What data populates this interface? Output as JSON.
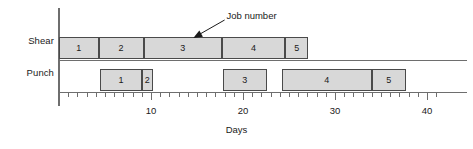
{
  "chart_data": {
    "type": "bar",
    "subtype": "gantt",
    "title": "",
    "xlabel": "Days",
    "ylabel": "",
    "xlim": [
      0,
      42
    ],
    "ylim": [
      0,
      2
    ],
    "grid": false,
    "legend": null,
    "x_ticks_major": [
      10,
      20,
      30,
      40
    ],
    "x_tick_labels": [
      "10",
      "20",
      "30",
      "40"
    ],
    "x_ticks_minor": [
      1,
      2,
      3,
      4,
      5,
      6,
      7,
      8,
      9,
      11,
      12,
      13,
      14,
      15,
      16,
      17,
      18,
      19,
      21,
      22,
      23,
      24,
      25,
      26,
      27,
      28,
      29,
      31,
      32,
      33,
      34,
      35,
      36,
      37,
      38,
      39,
      41
    ],
    "x_tick_step_minor": 1,
    "categories": [
      "Shear",
      "Punch"
    ],
    "bar_fill_color": "#d8d8d8",
    "bar_edge_color": "#4a4a4a",
    "axis_color": "#6e6e6e",
    "series": [
      {
        "name": "Shear",
        "tasks": [
          {
            "label": "1",
            "start": 0.0,
            "end": 4.3
          },
          {
            "label": "2",
            "start": 4.3,
            "end": 9.2
          },
          {
            "label": "3",
            "start": 9.2,
            "end": 17.7
          },
          {
            "label": "4",
            "start": 17.7,
            "end": 24.6
          },
          {
            "label": "5",
            "start": 24.6,
            "end": 27.1
          }
        ]
      },
      {
        "name": "Punch",
        "tasks": [
          {
            "label": "1",
            "start": 4.5,
            "end": 9.0
          },
          {
            "label": "2",
            "start": 9.0,
            "end": 10.2
          },
          {
            "label": "3",
            "start": 17.8,
            "end": 22.6
          },
          {
            "label": "4",
            "start": 24.2,
            "end": 34.0
          },
          {
            "label": "5",
            "start": 34.0,
            "end": 37.7
          }
        ]
      }
    ],
    "annotations": [
      {
        "text": "Job number",
        "text_x": 18.2,
        "text_y": 2.35,
        "arrow_from_x": 18.0,
        "arrow_from_y": 2.22,
        "arrow_to_x": 14.6,
        "arrow_to_y": 1.62
      }
    ]
  }
}
